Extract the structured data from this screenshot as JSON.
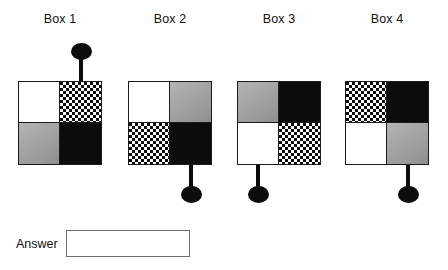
{
  "question": {
    "answer_label": "Answer",
    "answer_value": "",
    "answer_placeholder": ""
  },
  "boxes": [
    {
      "label": "Box 1",
      "left": 18,
      "top": 81,
      "size": 84,
      "quadrants": {
        "top_left": "white",
        "top_right": "checker",
        "bottom_left": "gray",
        "bottom_right": "black"
      },
      "pointer": {
        "direction": "up",
        "attached_quadrant": "top_right",
        "offset_x": 63,
        "stem_length": 24
      }
    },
    {
      "label": "Box 2",
      "left": 128,
      "top": 81,
      "size": 84,
      "quadrants": {
        "top_left": "white",
        "top_right": "gray",
        "bottom_left": "checker",
        "bottom_right": "black"
      },
      "pointer": {
        "direction": "down",
        "attached_quadrant": "bottom_right",
        "offset_x": 63,
        "stem_length": 24
      }
    },
    {
      "label": "Box 3",
      "left": 237,
      "top": 81,
      "size": 84,
      "quadrants": {
        "top_left": "gray",
        "top_right": "black",
        "bottom_left": "white",
        "bottom_right": "checker"
      },
      "pointer": {
        "direction": "down",
        "attached_quadrant": "bottom_left",
        "offset_x": 21,
        "stem_length": 24
      }
    },
    {
      "label": "Box 4",
      "left": 345,
      "top": 81,
      "size": 84,
      "quadrants": {
        "top_left": "checker",
        "top_right": "black",
        "bottom_left": "white",
        "bottom_right": "gray"
      },
      "pointer": {
        "direction": "down",
        "attached_quadrant": "bottom_right",
        "offset_x": 63,
        "stem_length": 24
      }
    }
  ],
  "layout": {
    "label_top": 12,
    "answer_left": 16,
    "answer_top": 230
  },
  "colors": {
    "black": "#0c0c0c",
    "white": "#ffffff",
    "gray": "#a2a2a2",
    "outline": "#1b1b1b",
    "input_border": "#707070",
    "text": "#111111"
  }
}
